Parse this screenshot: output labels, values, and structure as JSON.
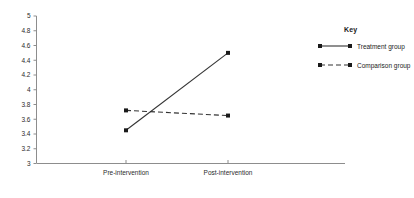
{
  "chart_data": {
    "type": "line",
    "title": "",
    "xlabel": "",
    "ylabel": "",
    "categories": [
      "Pre-intervention",
      "Post-intervention"
    ],
    "ylim": [
      3,
      5
    ],
    "ytick_labels": [
      "5",
      "4.8",
      "4.6",
      "4.4",
      "4.2",
      "4",
      "3.8",
      "3.6",
      "3.4",
      "3.2",
      "3"
    ],
    "ytick_values": [
      5,
      4.8,
      4.6,
      4.4,
      4.2,
      4,
      3.8,
      3.6,
      3.4,
      3.2,
      3
    ],
    "grid": false,
    "legend_position": "right",
    "series": [
      {
        "name": "Treatment group",
        "style": "solid",
        "values": [
          3.45,
          4.5
        ]
      },
      {
        "name": "Comparison group",
        "style": "dashed",
        "values": [
          3.72,
          3.65
        ]
      }
    ]
  },
  "legend": {
    "title": "Key",
    "entries": [
      {
        "label": "Treatment group",
        "style": "solid"
      },
      {
        "label": "Comparison group",
        "style": "dashed"
      }
    ]
  },
  "colors": {
    "series": "#333333",
    "axis": "#8d8d8d",
    "text": "#1a1a1a",
    "background": "#ffffff"
  }
}
